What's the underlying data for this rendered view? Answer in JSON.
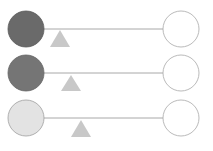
{
  "diagram": {
    "title": "",
    "colors": {
      "line": "#a8a8a8",
      "fulcrum": "#c8c8c8",
      "right_mass_fill": "#ffffff",
      "right_mass_stroke": "#a8a8a8"
    },
    "levers": [
      {
        "left_mass_color": "#6a6a6a",
        "left_stroke": "#5a5a5a",
        "fulcrum_x": 60,
        "y": 29
      },
      {
        "left_mass_color": "#757575",
        "left_stroke": "#666666",
        "fulcrum_x": 71,
        "y": 73
      },
      {
        "left_mass_color": "#e3e3e3",
        "left_stroke": "#a0a0a0",
        "fulcrum_x": 81,
        "y": 118
      }
    ]
  }
}
